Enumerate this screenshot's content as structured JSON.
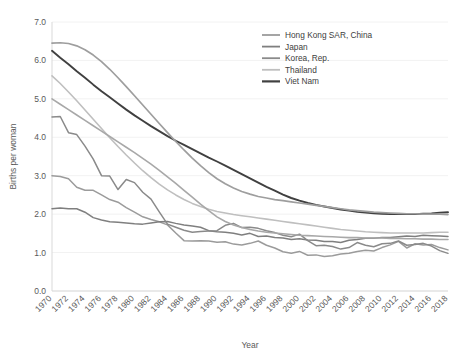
{
  "chart_data": {
    "type": "line",
    "title": "",
    "xlabel": "Year",
    "ylabel": "Births per woman",
    "xlim": [
      1970,
      2018
    ],
    "ylim": [
      0.0,
      7.0
    ],
    "yticks": [
      "0.0",
      "1.0",
      "2.0",
      "3.0",
      "4.0",
      "5.0",
      "6.0",
      "7.0"
    ],
    "xticks": [
      "1970",
      "1972",
      "1974",
      "1976",
      "1978",
      "1980",
      "1982",
      "1984",
      "1986",
      "1988",
      "1990",
      "1992",
      "1994",
      "1996",
      "1998",
      "2000",
      "2002",
      "2004",
      "2006",
      "2008",
      "2010",
      "2012",
      "2014",
      "2016",
      "2018"
    ],
    "grid": true,
    "legend_position": "top-right",
    "x": [
      1970,
      1971,
      1972,
      1973,
      1974,
      1975,
      1976,
      1977,
      1978,
      1979,
      1980,
      1981,
      1982,
      1983,
      1984,
      1985,
      1986,
      1987,
      1988,
      1989,
      1990,
      1991,
      1992,
      1993,
      1994,
      1995,
      1996,
      1997,
      1998,
      1999,
      2000,
      2001,
      2002,
      2003,
      2004,
      2005,
      2006,
      2007,
      2008,
      2009,
      2010,
      2011,
      2012,
      2013,
      2014,
      2015,
      2016,
      2017,
      2018
    ],
    "series": [
      {
        "name": "Hong Kong SAR, China",
        "color": "#9b9b9b",
        "width": 1.5,
        "values": [
          3.0,
          2.98,
          2.92,
          2.7,
          2.62,
          2.62,
          2.5,
          2.38,
          2.31,
          2.17,
          2.05,
          1.93,
          1.86,
          1.8,
          1.72,
          1.51,
          1.31,
          1.3,
          1.31,
          1.3,
          1.27,
          1.28,
          1.22,
          1.2,
          1.24,
          1.3,
          1.19,
          1.12,
          1.02,
          0.98,
          1.03,
          0.93,
          0.94,
          0.9,
          0.92,
          0.96,
          0.98,
          1.03,
          1.06,
          1.04,
          1.13,
          1.2,
          1.29,
          1.12,
          1.23,
          1.2,
          1.21,
          1.13,
          1.07
        ]
      },
      {
        "name": "Japan",
        "color": "#7f7f7f",
        "width": 1.5,
        "values": [
          2.14,
          2.16,
          2.14,
          2.14,
          2.05,
          1.91,
          1.85,
          1.8,
          1.79,
          1.77,
          1.75,
          1.74,
          1.77,
          1.8,
          1.81,
          1.76,
          1.72,
          1.69,
          1.66,
          1.57,
          1.54,
          1.53,
          1.5,
          1.46,
          1.5,
          1.42,
          1.43,
          1.39,
          1.38,
          1.34,
          1.36,
          1.33,
          1.32,
          1.29,
          1.29,
          1.26,
          1.32,
          1.34,
          1.37,
          1.37,
          1.39,
          1.39,
          1.41,
          1.43,
          1.42,
          1.45,
          1.44,
          1.43,
          1.42
        ]
      },
      {
        "name": "Korea, Rep.",
        "color": "#8a8a8a",
        "width": 1.5,
        "values": [
          4.53,
          4.54,
          4.12,
          4.07,
          3.77,
          3.43,
          3.0,
          2.99,
          2.64,
          2.9,
          2.82,
          2.57,
          2.39,
          2.06,
          1.74,
          1.66,
          1.58,
          1.53,
          1.55,
          1.56,
          1.57,
          1.71,
          1.76,
          1.65,
          1.66,
          1.63,
          1.57,
          1.52,
          1.45,
          1.41,
          1.48,
          1.31,
          1.18,
          1.19,
          1.16,
          1.09,
          1.13,
          1.26,
          1.19,
          1.15,
          1.23,
          1.24,
          1.3,
          1.19,
          1.21,
          1.24,
          1.17,
          1.05,
          0.98
        ]
      },
      {
        "name": "Thailand",
        "color": "#bfbfbf",
        "width": 1.6,
        "values": [
          5.6,
          5.4,
          5.18,
          4.95,
          4.71,
          4.47,
          4.23,
          3.99,
          3.76,
          3.54,
          3.33,
          3.13,
          2.95,
          2.78,
          2.63,
          2.5,
          2.38,
          2.28,
          2.2,
          2.13,
          2.07,
          2.03,
          1.99,
          1.96,
          1.93,
          1.9,
          1.87,
          1.84,
          1.81,
          1.78,
          1.75,
          1.72,
          1.69,
          1.66,
          1.63,
          1.6,
          1.58,
          1.56,
          1.54,
          1.53,
          1.52,
          1.51,
          1.51,
          1.51,
          1.51,
          1.51,
          1.52,
          1.53,
          1.53
        ]
      },
      {
        "name": "Viet Nam",
        "color": "#404040",
        "width": 1.9,
        "values": [
          6.25,
          6.07,
          5.9,
          5.72,
          5.55,
          5.37,
          5.2,
          5.04,
          4.88,
          4.72,
          4.57,
          4.43,
          4.29,
          4.16,
          4.03,
          3.91,
          3.8,
          3.69,
          3.58,
          3.47,
          3.37,
          3.26,
          3.15,
          3.04,
          2.93,
          2.82,
          2.71,
          2.61,
          2.51,
          2.42,
          2.35,
          2.29,
          2.24,
          2.2,
          2.16,
          2.12,
          2.09,
          2.06,
          2.04,
          2.02,
          2.01,
          2.0,
          2.0,
          2.0,
          2.0,
          2.01,
          2.02,
          2.04,
          2.05
        ]
      },
      {
        "name": "series-6",
        "color": "#9e9e9e",
        "width": 1.7,
        "values": [
          6.45,
          6.46,
          6.44,
          6.38,
          6.28,
          6.14,
          5.97,
          5.77,
          5.55,
          5.32,
          5.08,
          4.84,
          4.6,
          4.36,
          4.12,
          3.89,
          3.67,
          3.46,
          3.26,
          3.08,
          2.92,
          2.79,
          2.68,
          2.59,
          2.52,
          2.46,
          2.42,
          2.38,
          2.35,
          2.32,
          2.29,
          2.26,
          2.23,
          2.2,
          2.17,
          2.14,
          2.11,
          2.09,
          2.07,
          2.05,
          2.04,
          2.03,
          2.02,
          2.01,
          2.01,
          2.0,
          2.0,
          2.0,
          1.99
        ]
      },
      {
        "name": "series-7",
        "color": "#a8a8a8",
        "width": 1.6,
        "values": [
          5.0,
          4.86,
          4.72,
          4.58,
          4.44,
          4.3,
          4.16,
          4.02,
          3.88,
          3.74,
          3.6,
          3.45,
          3.3,
          3.14,
          2.97,
          2.8,
          2.62,
          2.44,
          2.26,
          2.09,
          1.93,
          1.81,
          1.72,
          1.65,
          1.6,
          1.56,
          1.53,
          1.51,
          1.49,
          1.47,
          1.45,
          1.44,
          1.43,
          1.42,
          1.41,
          1.4,
          1.39,
          1.39,
          1.38,
          1.38,
          1.38,
          1.37,
          1.37,
          1.36,
          1.36,
          1.35,
          1.35,
          1.34,
          1.34
        ]
      }
    ]
  }
}
